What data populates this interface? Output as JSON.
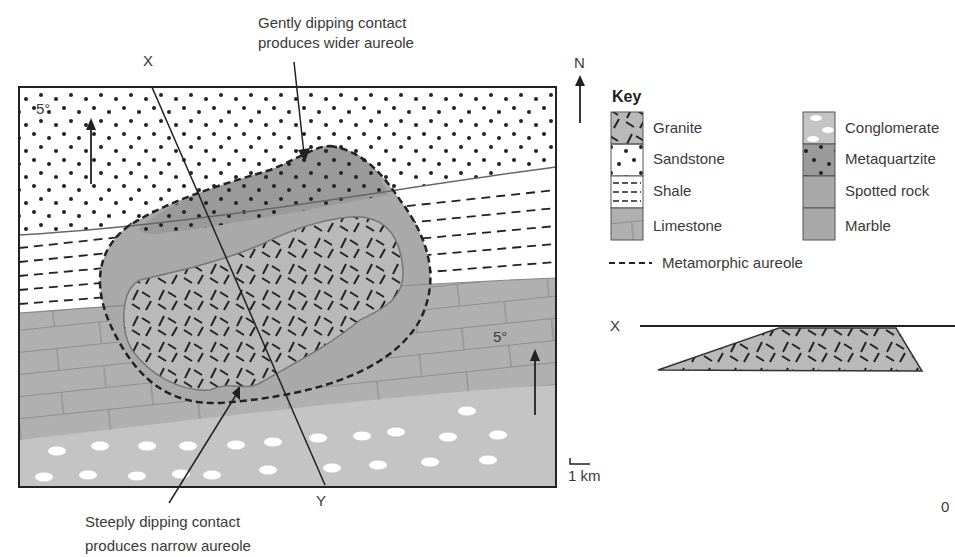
{
  "annotations": {
    "top_line1": "Gently dipping contact",
    "top_line2": "produces wider aureole",
    "bottom_line1": "Steeply dipping contact",
    "bottom_line2": "produces narrow aureole"
  },
  "map": {
    "section_start": "X",
    "section_end": "Y",
    "dip_top_left": "5°",
    "dip_right": "5°",
    "north_label": "N",
    "scale_label": "1 km"
  },
  "key": {
    "title": "Key",
    "items_left": [
      {
        "label": "Granite",
        "pattern": "granite"
      },
      {
        "label": "Sandstone",
        "pattern": "sandstone"
      },
      {
        "label": "Shale",
        "pattern": "shale"
      },
      {
        "label": "Limestone",
        "pattern": "limestone"
      }
    ],
    "items_right": [
      {
        "label": "Conglomerate",
        "pattern": "conglomerate"
      },
      {
        "label": "Metaquartzite",
        "pattern": "metaquartzite"
      },
      {
        "label": "Spotted rock",
        "pattern": "spotted"
      },
      {
        "label": "Marble",
        "pattern": "marble"
      }
    ],
    "aureole_label": "Metamorphic aureole"
  },
  "cross_section": {
    "label_x": "X",
    "scale_zero": "0"
  },
  "colors": {
    "granite_fill": "#b9b9b9",
    "aureole_dark": "#9a9a9a",
    "aureole_mid": "#a9a9a9",
    "limestone": "#b0b0b0",
    "conglomerate": "#c4c4c4",
    "line": "#222222"
  }
}
